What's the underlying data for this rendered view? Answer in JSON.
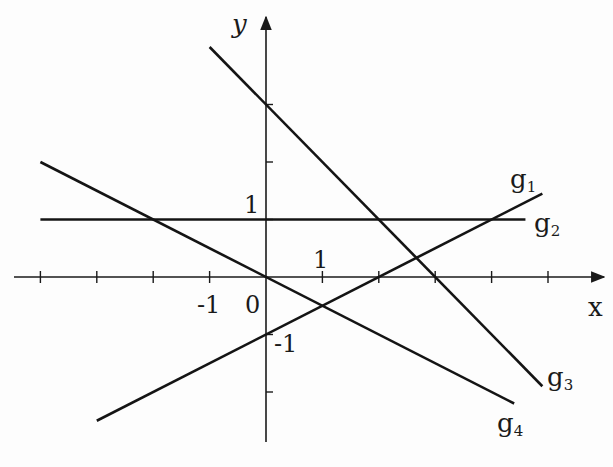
{
  "chart_data": {
    "type": "line",
    "title": "",
    "xlabel": "x",
    "ylabel": "y",
    "xlim": [
      -4,
      6
    ],
    "ylim": [
      -2.9,
      4.5
    ],
    "grid": false,
    "x_ticks": [
      -4,
      -3,
      -2,
      -1,
      0,
      1,
      2,
      3,
      4,
      5
    ],
    "y_ticks": [
      -2,
      -1,
      0,
      1,
      2,
      3
    ],
    "tick_labels": {
      "x_minus1": "-1",
      "origin": "0",
      "x_1": "1",
      "y_1": "1",
      "y_minus1": "-1"
    },
    "series": [
      {
        "name": "g1",
        "equation": "y = 0.5x - 1",
        "x": [
          -3,
          4.9
        ],
        "y": [
          -2.5,
          1.45
        ]
      },
      {
        "name": "g2",
        "equation": "y = 1",
        "x": [
          -4,
          4.6
        ],
        "y": [
          1,
          1
        ]
      },
      {
        "name": "g3",
        "equation": "y = -x + 3",
        "x": [
          -1,
          4.9
        ],
        "y": [
          4,
          -1.9
        ]
      },
      {
        "name": "g4",
        "equation": "y = -0.5x",
        "x": [
          -4,
          4.4
        ],
        "y": [
          2,
          -2.2
        ]
      }
    ],
    "legend": "inline labels at line ends",
    "labels": {
      "g1": {
        "base": "g",
        "sub": "1"
      },
      "g2": {
        "base": "g",
        "sub": "2"
      },
      "g3": {
        "base": "g",
        "sub": "3"
      },
      "g4": {
        "base": "g",
        "sub": "4"
      }
    }
  }
}
